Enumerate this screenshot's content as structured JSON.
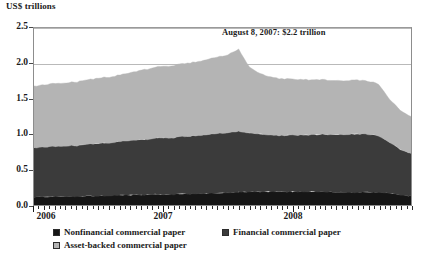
{
  "axis": {
    "unit_caption": "US$ trillions",
    "y_ticks": [
      "0.0",
      "0.5",
      "1.0",
      "1.5",
      "2.0",
      "2.5"
    ],
    "x_ticks": [
      "2006",
      "2007",
      "2008"
    ]
  },
  "annotation": {
    "text": "August 8, 2007: $2.2 trillion"
  },
  "legend": {
    "items": [
      {
        "label": "Nonfinancial commercial paper",
        "color": "#161616"
      },
      {
        "label": "Financial commercial paper",
        "color": "#3b3b3b"
      },
      {
        "label": "Asset-backed commercial paper",
        "color": "#b4b4b4"
      }
    ]
  },
  "colors": {
    "nonfinancial": "#161616",
    "financial": "#3b3b3b",
    "assetbacked": "#b4b4b4",
    "frame": "#8d8d8d",
    "grid": "#b9b9b9"
  },
  "chart_data": {
    "type": "area",
    "stacked": true,
    "title": "",
    "subtitle": "",
    "xlabel": "",
    "ylabel": "US$ trillions",
    "ylim": [
      0.0,
      2.5
    ],
    "xlim": [
      "2006-01",
      "2008-12"
    ],
    "grid": true,
    "legend_position": "bottom",
    "tick_labels_x": [
      "2006",
      "2007",
      "2008"
    ],
    "tick_labels_y": [
      "0.0",
      "0.5",
      "1.0",
      "1.5",
      "2.0",
      "2.5"
    ],
    "annotations": [
      {
        "text": "August 8, 2007: $2.2 trillion",
        "x": "2007-08-08",
        "y": 2.2
      }
    ],
    "x": [
      "2006-01",
      "2006-02",
      "2006-03",
      "2006-04",
      "2006-05",
      "2006-06",
      "2006-07",
      "2006-08",
      "2006-09",
      "2006-10",
      "2006-11",
      "2006-12",
      "2007-01",
      "2007-02",
      "2007-03",
      "2007-04",
      "2007-05",
      "2007-06",
      "2007-07",
      "2007-08",
      "2007-09",
      "2007-10",
      "2007-11",
      "2007-12",
      "2008-01",
      "2008-02",
      "2008-03",
      "2008-04",
      "2008-05",
      "2008-06",
      "2008-07",
      "2008-08",
      "2008-09",
      "2008-10",
      "2008-11",
      "2008-12"
    ],
    "series": [
      {
        "name": "Nonfinancial commercial paper",
        "color": "#161616",
        "values": [
          0.11,
          0.11,
          0.12,
          0.12,
          0.12,
          0.13,
          0.13,
          0.13,
          0.14,
          0.14,
          0.14,
          0.15,
          0.15,
          0.15,
          0.16,
          0.16,
          0.16,
          0.17,
          0.17,
          0.18,
          0.19,
          0.19,
          0.19,
          0.19,
          0.19,
          0.19,
          0.19,
          0.19,
          0.18,
          0.18,
          0.18,
          0.18,
          0.18,
          0.17,
          0.14,
          0.13
        ]
      },
      {
        "name": "Financial commercial paper",
        "color": "#3b3b3b",
        "values": [
          0.7,
          0.71,
          0.71,
          0.72,
          0.72,
          0.73,
          0.74,
          0.75,
          0.76,
          0.77,
          0.78,
          0.79,
          0.8,
          0.8,
          0.81,
          0.82,
          0.83,
          0.84,
          0.85,
          0.86,
          0.83,
          0.81,
          0.8,
          0.79,
          0.8,
          0.8,
          0.8,
          0.81,
          0.81,
          0.82,
          0.82,
          0.82,
          0.8,
          0.72,
          0.64,
          0.6
        ]
      },
      {
        "name": "Asset-backed commercial paper",
        "color": "#b4b4b4",
        "values": [
          0.87,
          0.88,
          0.89,
          0.89,
          0.9,
          0.91,
          0.92,
          0.93,
          0.94,
          0.96,
          0.98,
          1.0,
          1.01,
          1.02,
          1.03,
          1.04,
          1.06,
          1.08,
          1.1,
          1.16,
          0.93,
          0.85,
          0.82,
          0.8,
          0.79,
          0.78,
          0.77,
          0.77,
          0.76,
          0.76,
          0.76,
          0.75,
          0.73,
          0.61,
          0.55,
          0.52
        ]
      }
    ],
    "totals": [
      1.68,
      1.7,
      1.72,
      1.73,
      1.74,
      1.77,
      1.79,
      1.81,
      1.84,
      1.87,
      1.9,
      1.94,
      1.96,
      1.97,
      2.0,
      2.02,
      2.05,
      2.09,
      2.12,
      2.2,
      1.95,
      1.85,
      1.81,
      1.78,
      1.78,
      1.77,
      1.76,
      1.77,
      1.75,
      1.76,
      1.76,
      1.75,
      1.71,
      1.5,
      1.33,
      1.25
    ]
  }
}
